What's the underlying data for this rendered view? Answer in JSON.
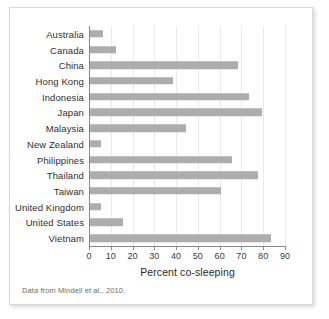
{
  "figure": {
    "source_note": "Data from Mindell et al., 2010.",
    "bar_color": "#adadad",
    "grid_color": "#e9e9e9",
    "axis_color": "#8a8a8a",
    "background": "#ffffff"
  },
  "chart_data": {
    "type": "bar",
    "orientation": "horizontal",
    "title": "",
    "subtitle": "",
    "xlabel": "Percent co-sleeping",
    "ylabel": "",
    "xlim": [
      0,
      90
    ],
    "xticks": [
      0,
      10,
      20,
      30,
      40,
      50,
      60,
      70,
      80,
      90
    ],
    "xtick_labels": [
      "0",
      "10",
      "20",
      "30",
      "40",
      "50",
      "60",
      "70",
      "80",
      "90"
    ],
    "grid": true,
    "grid_axis": "x",
    "legend": false,
    "categories": [
      "Australia",
      "Canada",
      "China",
      "Hong Kong",
      "Indonesia",
      "Japan",
      "Malaysia",
      "New Zealand",
      "Philippines",
      "Thailand",
      "Taiwan",
      "United Kingdom",
      "United  States",
      "Vietnam"
    ],
    "values": [
      6,
      12,
      68,
      38,
      73,
      79,
      44,
      5,
      65,
      77,
      60,
      5,
      15,
      83
    ],
    "annotations": [
      "Data from Mindell et al., 2010."
    ]
  }
}
